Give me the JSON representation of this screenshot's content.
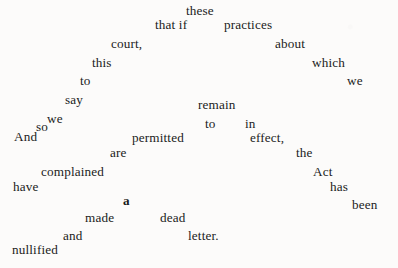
{
  "page": {
    "kind": "scattered-text-figure",
    "background_color": "#fcfbfa",
    "text_color": "#1b1b1b",
    "width": 398,
    "height": 268,
    "reading_order_sentence": "And so we say to this court, that if these practices about which we complained are permitted to remain in effect, the Act has been made a dead letter. nullified"
  },
  "words": [
    {
      "text": "these",
      "x": 186,
      "y": 4,
      "bold": false
    },
    {
      "text": "that if",
      "x": 155,
      "y": 18,
      "bold": false
    },
    {
      "text": "practices",
      "x": 224,
      "y": 18,
      "bold": false
    },
    {
      "text": "court,",
      "x": 111,
      "y": 37,
      "bold": false
    },
    {
      "text": "about",
      "x": 275,
      "y": 37,
      "bold": false
    },
    {
      "text": "this",
      "x": 92,
      "y": 56,
      "bold": false
    },
    {
      "text": "which",
      "x": 312,
      "y": 56,
      "bold": false
    },
    {
      "text": "to",
      "x": 80,
      "y": 74,
      "bold": false
    },
    {
      "text": "we",
      "x": 347,
      "y": 74,
      "bold": false
    },
    {
      "text": "say",
      "x": 65,
      "y": 93,
      "bold": false
    },
    {
      "text": "remain",
      "x": 198,
      "y": 98,
      "bold": false
    },
    {
      "text": "we",
      "x": 47,
      "y": 112,
      "bold": false
    },
    {
      "text": "so",
      "x": 36,
      "y": 120,
      "bold": false
    },
    {
      "text": "to",
      "x": 205,
      "y": 117,
      "bold": false
    },
    {
      "text": "in",
      "x": 245,
      "y": 117,
      "bold": false
    },
    {
      "text": "And",
      "x": 14,
      "y": 130,
      "bold": false
    },
    {
      "text": "permitted",
      "x": 132,
      "y": 131,
      "bold": false
    },
    {
      "text": "effect,",
      "x": 250,
      "y": 131,
      "bold": false
    },
    {
      "text": "are",
      "x": 110,
      "y": 146,
      "bold": false
    },
    {
      "text": "the",
      "x": 296,
      "y": 146,
      "bold": false
    },
    {
      "text": "complained",
      "x": 41,
      "y": 165,
      "bold": false
    },
    {
      "text": "Act",
      "x": 313,
      "y": 165,
      "bold": false
    },
    {
      "text": "have",
      "x": 13,
      "y": 180,
      "bold": false
    },
    {
      "text": "has",
      "x": 330,
      "y": 180,
      "bold": false
    },
    {
      "text": "a",
      "x": 123,
      "y": 194,
      "bold": true
    },
    {
      "text": "been",
      "x": 352,
      "y": 198,
      "bold": false
    },
    {
      "text": "made",
      "x": 85,
      "y": 211,
      "bold": false
    },
    {
      "text": "dead",
      "x": 160,
      "y": 211,
      "bold": false
    },
    {
      "text": "and",
      "x": 63,
      "y": 229,
      "bold": false
    },
    {
      "text": "letter.",
      "x": 188,
      "y": 229,
      "bold": false
    },
    {
      "text": "nullified",
      "x": 12,
      "y": 243,
      "bold": false
    }
  ]
}
